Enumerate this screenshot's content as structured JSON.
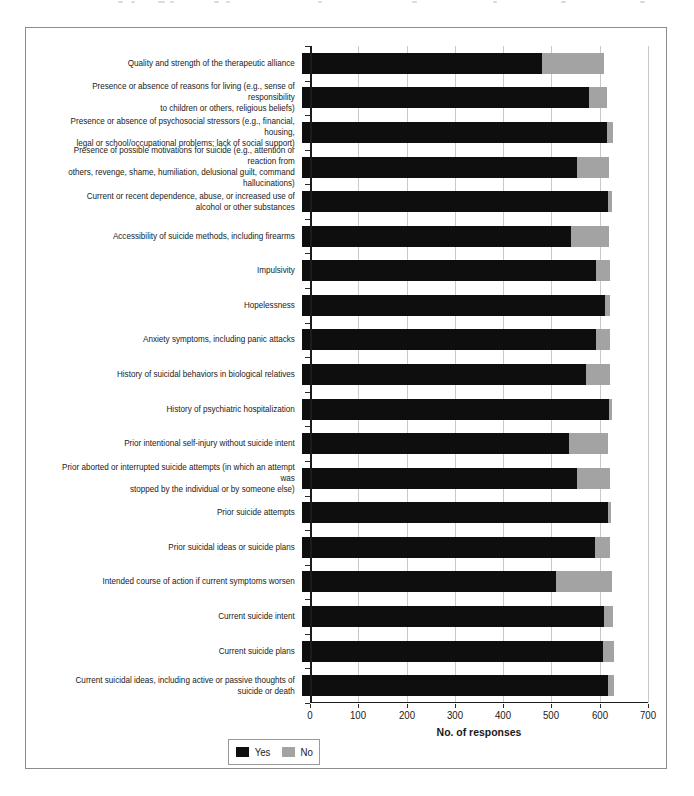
{
  "figure": {
    "xlabel": "No. of responses",
    "legend": {
      "yes_label": "Yes",
      "no_label": "No"
    },
    "colors": {
      "yes": "#0e0e0e",
      "no": "#a3a3a3",
      "grid": "#c9c9c9",
      "axis": "#1c1c1c"
    }
  },
  "chart_data": {
    "type": "bar",
    "orientation": "horizontal",
    "stacked": true,
    "title": "",
    "xlabel": "No. of responses",
    "ylabel": "",
    "xlim": [
      0,
      700
    ],
    "xticks": [
      0,
      100,
      200,
      300,
      400,
      500,
      600,
      700
    ],
    "grid": "vertical",
    "legend_position": "bottom-left",
    "categories": [
      "Quality and strength of the therapeutic alliance",
      "Presence or absence of reasons for living (e.g., sense of responsibility to children or others, religious beliefs)",
      "Presence or absence of psychosocial stressors (e.g., financial, housing, legal or school/occupational problems; lack of social support)",
      "Presence of possible motivations for suicide (e.g., attention or reaction from others, revenge, shame, humiliation, delusional guilt, command hallucinations)",
      "Current or recent dependence, abuse, or increased use of alcohol or other substances",
      "Accessibility of suicide methods, including firearms",
      "Impulsivity",
      "Hopelessness",
      "Anxiety symptoms, including panic attacks",
      "History of suicidal behaviors in biological relatives",
      "History of psychiatric hospitalization",
      "Prior intentional self-injury without suicide intent",
      "Prior aborted or interrupted suicide attempts (in which an attempt was stopped by the individual or by someone else)",
      "Prior suicide attempts",
      "Prior suicidal ideas or suicide plans",
      "Intended course of action if current symptoms worsen",
      "Current suicide intent",
      "Current suicide plans",
      "Current suicidal ideas, including active or passive thoughts of suicide or death"
    ],
    "category_lines": [
      [
        "Quality and strength of the therapeutic alliance"
      ],
      [
        "Presence or absence of reasons for living (e.g., sense of responsibility",
        "to children or others, religious beliefs)"
      ],
      [
        "Presence or absence of psychosocial stressors (e.g., financial, housing,",
        "legal or school/occupational problems; lack of social support)"
      ],
      [
        "Presence of possible motivations for suicide (e.g., attention or reaction from",
        "others, revenge, shame, humiliation, delusional guilt, command hallucinations)"
      ],
      [
        "Current or recent dependence, abuse, or increased use of",
        "alcohol or other substances"
      ],
      [
        "Accessibility of suicide methods, including firearms"
      ],
      [
        "Impulsivity"
      ],
      [
        "Hopelessness"
      ],
      [
        "Anxiety symptoms, including panic attacks"
      ],
      [
        "History of suicidal behaviors in biological relatives"
      ],
      [
        "History of psychiatric hospitalization"
      ],
      [
        "Prior intentional self-injury without suicide intent"
      ],
      [
        "Prior aborted or interrupted suicide attempts (in which an attempt was",
        "stopped by the individual or by someone else)"
      ],
      [
        "Prior suicide attempts"
      ],
      [
        "Prior suicidal ideas or suicide plans"
      ],
      [
        "Intended course of action if current symptoms worsen"
      ],
      [
        "Current suicide intent"
      ],
      [
        "Current suicide plans"
      ],
      [
        "Current suicidal ideas, including active or passive thoughts of",
        "suicide or death"
      ]
    ],
    "series": [
      {
        "name": "Yes",
        "color": "#0e0e0e",
        "values": [
          485,
          580,
          618,
          556,
          620,
          544,
          594,
          614,
          595,
          575,
          621,
          541,
          556,
          619,
          592,
          514,
          610,
          608,
          619
        ]
      },
      {
        "name": "No",
        "color": "#a3a3a3",
        "values": [
          125,
          38,
          12,
          66,
          8,
          78,
          29,
          10,
          29,
          48,
          6,
          79,
          68,
          6,
          31,
          113,
          19,
          23,
          13
        ]
      }
    ]
  }
}
